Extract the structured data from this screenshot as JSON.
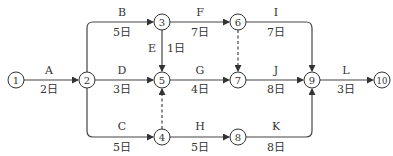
{
  "diagram": {
    "type": "activity-on-arrow network",
    "unit": "日",
    "nodes": [
      {
        "id": "1",
        "label": "1",
        "x": 16,
        "y": 80
      },
      {
        "id": "2",
        "label": "2",
        "x": 87,
        "y": 80
      },
      {
        "id": "3",
        "label": "3",
        "x": 162,
        "y": 22
      },
      {
        "id": "4",
        "label": "4",
        "x": 162,
        "y": 137
      },
      {
        "id": "5",
        "label": "5",
        "x": 162,
        "y": 80
      },
      {
        "id": "6",
        "label": "6",
        "x": 238,
        "y": 22
      },
      {
        "id": "7",
        "label": "7",
        "x": 238,
        "y": 80
      },
      {
        "id": "8",
        "label": "8",
        "x": 238,
        "y": 137
      },
      {
        "id": "9",
        "label": "9",
        "x": 312,
        "y": 80
      },
      {
        "id": "10",
        "label": "10",
        "x": 382,
        "y": 80
      }
    ],
    "activities": [
      {
        "name": "A",
        "from": "1",
        "to": "2",
        "duration": "2日"
      },
      {
        "name": "B",
        "from": "2",
        "to": "3",
        "duration": "5日"
      },
      {
        "name": "C",
        "from": "2",
        "to": "4",
        "duration": "5日"
      },
      {
        "name": "D",
        "from": "2",
        "to": "5",
        "duration": "3日"
      },
      {
        "name": "E",
        "from": "3",
        "to": "5",
        "duration": "1日"
      },
      {
        "name": "F",
        "from": "3",
        "to": "6",
        "duration": "7日"
      },
      {
        "name": "G",
        "from": "5",
        "to": "7",
        "duration": "4日"
      },
      {
        "name": "H",
        "from": "4",
        "to": "8",
        "duration": "5日"
      },
      {
        "name": "I",
        "from": "6",
        "to": "9",
        "duration": "7日"
      },
      {
        "name": "J",
        "from": "7",
        "to": "9",
        "duration": "8日"
      },
      {
        "name": "K",
        "from": "8",
        "to": "9",
        "duration": "8日"
      },
      {
        "name": "L",
        "from": "9",
        "to": "10",
        "duration": "3日"
      }
    ],
    "dummy_activities": [
      {
        "from": "6",
        "to": "7"
      },
      {
        "from": "4",
        "to": "5"
      }
    ],
    "labels": {
      "A": "A",
      "A_d": "2日",
      "B": "B",
      "B_d": "5日",
      "C": "C",
      "C_d": "5日",
      "D": "D",
      "D_d": "3日",
      "E": "E",
      "E_d": "1日",
      "F": "F",
      "F_d": "7日",
      "G": "G",
      "G_d": "4日",
      "H": "H",
      "H_d": "5日",
      "I": "I",
      "I_d": "7日",
      "J": "J",
      "J_d": "8日",
      "K": "K",
      "K_d": "8日",
      "L": "L",
      "L_d": "3日",
      "n1": "1",
      "n2": "2",
      "n3": "3",
      "n4": "4",
      "n5": "5",
      "n6": "6",
      "n7": "7",
      "n8": "8",
      "n9": "9",
      "n10": "10"
    },
    "colors": {
      "line": "#444444",
      "text": "#333333",
      "background": "#ffffff"
    }
  }
}
